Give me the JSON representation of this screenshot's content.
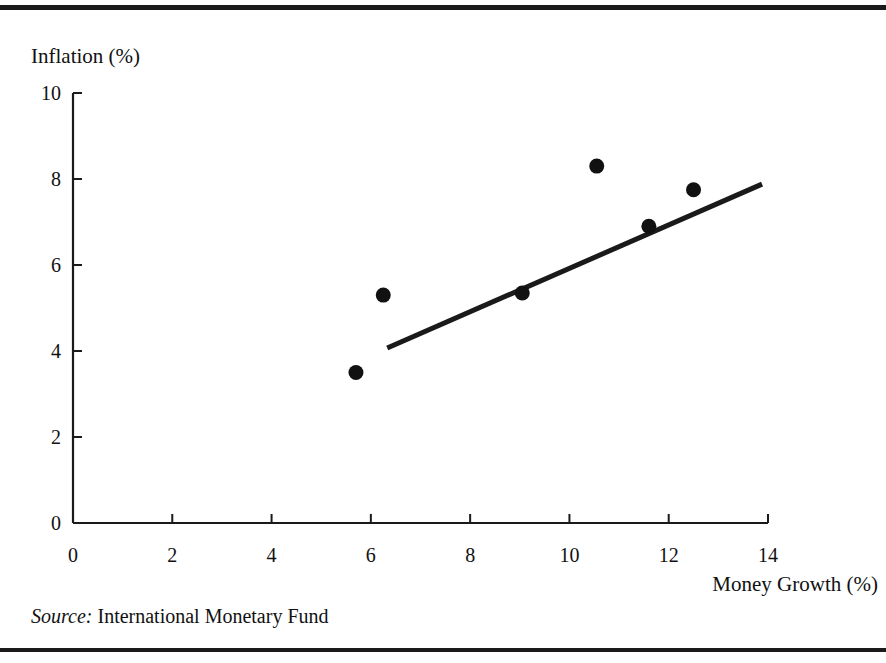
{
  "figure": {
    "source_prefix": "Source:",
    "source_text": "International Monetary Fund"
  },
  "chart_data": {
    "type": "scatter",
    "title": "",
    "xlabel": "Money Growth (%)",
    "ylabel": "Inflation (%)",
    "xlim": [
      0,
      14
    ],
    "ylim": [
      0,
      10
    ],
    "xticks": [
      0,
      2,
      4,
      6,
      8,
      10,
      12,
      14
    ],
    "xtick_labels": [
      "0",
      "2",
      "4",
      "6",
      "8",
      "10",
      "12",
      "14"
    ],
    "yticks": [
      0,
      2,
      4,
      6,
      8,
      10
    ],
    "ytick_labels": [
      "0",
      "2",
      "4",
      "6",
      "8",
      "10"
    ],
    "grid": false,
    "legend": null,
    "marker": "filled-circle",
    "marker_color": "#111111",
    "points": [
      {
        "x": 5.7,
        "y": 3.5
      },
      {
        "x": 6.25,
        "y": 5.3
      },
      {
        "x": 9.05,
        "y": 5.35
      },
      {
        "x": 10.55,
        "y": 8.3
      },
      {
        "x": 11.6,
        "y": 6.9
      },
      {
        "x": 12.5,
        "y": 7.75
      }
    ],
    "series": [
      {
        "name": "Countries",
        "type": "scatter",
        "x": [
          5.7,
          6.25,
          9.05,
          9.05,
          10.55,
          11.6,
          12.5
        ],
        "values": [
          3.5,
          5.3,
          5.35,
          5.35,
          8.3,
          6.9,
          7.75
        ]
      },
      {
        "name": "Trend line",
        "type": "line",
        "x": [
          6.33,
          13.88
        ],
        "values": [
          4.07,
          7.88
        ],
        "color": "#1a1a1a"
      }
    ],
    "trendline": {
      "x_start": 6.33,
      "y_start": 4.07,
      "x_end": 13.88,
      "y_end": 7.88
    }
  }
}
